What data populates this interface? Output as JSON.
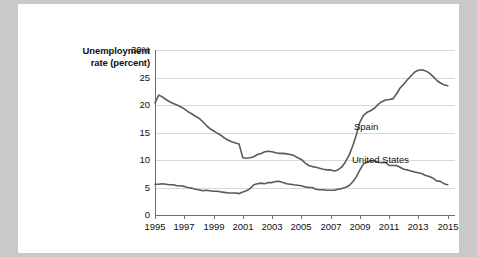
{
  "chart_data": {
    "type": "line",
    "title": "",
    "ylabel": "Unemployment rate (percent)",
    "ylabel_line1": "Unemployment",
    "ylabel_line2": "rate (percent)",
    "xlabel": "",
    "ylim": [
      0,
      30
    ],
    "yticks": [
      "0",
      "5",
      "10",
      "15",
      "20",
      "25",
      "30%"
    ],
    "ytick_values": [
      0,
      5,
      10,
      15,
      20,
      25,
      30
    ],
    "xlim": [
      1995,
      2015.5
    ],
    "xticks": [
      "1995",
      "1997",
      "1999",
      "2001",
      "2003",
      "2005",
      "2007",
      "2009",
      "2011",
      "2013",
      "2015"
    ],
    "xtick_values": [
      1995,
      1997,
      1999,
      2001,
      2003,
      2005,
      2007,
      2009,
      2011,
      2013,
      2015
    ],
    "grid": true,
    "legend_position": "inline-labels",
    "line_color": "#5a5a5a",
    "series": [
      {
        "name": "Spain",
        "x": [
          1995.0,
          1995.25,
          1995.5,
          1995.75,
          1996.0,
          1996.25,
          1996.5,
          1996.75,
          1997.0,
          1997.25,
          1997.5,
          1997.75,
          1998.0,
          1998.25,
          1998.5,
          1998.75,
          1999.0,
          1999.25,
          1999.5,
          1999.75,
          2000.0,
          2000.25,
          2000.5,
          2000.75,
          2001.0,
          2001.25,
          2001.5,
          2001.75,
          2002.0,
          2002.25,
          2002.5,
          2002.75,
          2003.0,
          2003.25,
          2003.5,
          2003.75,
          2004.0,
          2004.25,
          2004.5,
          2004.75,
          2005.0,
          2005.25,
          2005.5,
          2005.75,
          2006.0,
          2006.25,
          2006.5,
          2006.75,
          2007.0,
          2007.25,
          2007.5,
          2007.75,
          2008.0,
          2008.25,
          2008.5,
          2008.75,
          2009.0,
          2009.25,
          2009.5,
          2009.75,
          2010.0,
          2010.25,
          2010.5,
          2010.75,
          2011.0,
          2011.25,
          2011.5,
          2011.75,
          2012.0,
          2012.25,
          2012.5,
          2012.75,
          2013.0,
          2013.25,
          2013.5,
          2013.75,
          2014.0,
          2014.25,
          2014.5,
          2014.75,
          2015.0
        ],
        "values": [
          20.4,
          21.8,
          21.5,
          21.0,
          20.6,
          20.3,
          20.0,
          19.7,
          19.3,
          18.8,
          18.4,
          18.0,
          17.6,
          17.0,
          16.3,
          15.7,
          15.3,
          14.9,
          14.5,
          14.0,
          13.6,
          13.3,
          13.1,
          12.9,
          10.4,
          10.3,
          10.4,
          10.6,
          11.0,
          11.2,
          11.5,
          11.6,
          11.5,
          11.3,
          11.2,
          11.2,
          11.1,
          11.0,
          10.8,
          10.4,
          10.1,
          9.5,
          9.0,
          8.8,
          8.7,
          8.5,
          8.3,
          8.2,
          8.2,
          8.0,
          8.2,
          8.7,
          9.6,
          10.8,
          12.5,
          14.5,
          16.9,
          18.1,
          18.7,
          19.0,
          19.4,
          20.1,
          20.6,
          20.9,
          21.0,
          21.1,
          22.0,
          23.1,
          23.8,
          24.6,
          25.3,
          26.0,
          26.3,
          26.4,
          26.2,
          25.8,
          25.2,
          24.5,
          24.0,
          23.7,
          23.5
        ]
      },
      {
        "name": "United States",
        "x": [
          1995.0,
          1995.25,
          1995.5,
          1995.75,
          1996.0,
          1996.25,
          1996.5,
          1996.75,
          1997.0,
          1997.25,
          1997.5,
          1997.75,
          1998.0,
          1998.25,
          1998.5,
          1998.75,
          1999.0,
          1999.25,
          1999.5,
          1999.75,
          2000.0,
          2000.25,
          2000.5,
          2000.75,
          2001.0,
          2001.25,
          2001.5,
          2001.75,
          2002.0,
          2002.25,
          2002.5,
          2002.75,
          2003.0,
          2003.25,
          2003.5,
          2003.75,
          2004.0,
          2004.25,
          2004.5,
          2004.75,
          2005.0,
          2005.25,
          2005.5,
          2005.75,
          2006.0,
          2006.25,
          2006.5,
          2006.75,
          2007.0,
          2007.25,
          2007.5,
          2007.75,
          2008.0,
          2008.25,
          2008.5,
          2008.75,
          2009.0,
          2009.25,
          2009.5,
          2009.75,
          2010.0,
          2010.25,
          2010.5,
          2010.75,
          2011.0,
          2011.25,
          2011.5,
          2011.75,
          2012.0,
          2012.25,
          2012.5,
          2012.75,
          2013.0,
          2013.25,
          2013.5,
          2013.75,
          2014.0,
          2014.25,
          2014.5,
          2014.75,
          2015.0
        ],
        "values": [
          5.6,
          5.6,
          5.7,
          5.6,
          5.5,
          5.5,
          5.3,
          5.3,
          5.2,
          5.0,
          4.9,
          4.7,
          4.6,
          4.4,
          4.5,
          4.4,
          4.3,
          4.3,
          4.2,
          4.1,
          4.0,
          4.0,
          4.0,
          3.9,
          4.2,
          4.4,
          4.8,
          5.5,
          5.7,
          5.8,
          5.7,
          5.9,
          5.9,
          6.1,
          6.1,
          5.9,
          5.7,
          5.6,
          5.5,
          5.4,
          5.3,
          5.1,
          5.0,
          5.0,
          4.7,
          4.6,
          4.6,
          4.5,
          4.5,
          4.5,
          4.7,
          4.8,
          5.0,
          5.3,
          6.0,
          6.9,
          8.2,
          9.3,
          9.6,
          9.9,
          9.8,
          9.6,
          9.5,
          9.6,
          9.0,
          9.0,
          9.0,
          8.7,
          8.3,
          8.2,
          8.0,
          7.8,
          7.7,
          7.5,
          7.2,
          7.0,
          6.7,
          6.2,
          6.1,
          5.7,
          5.5
        ]
      }
    ]
  }
}
